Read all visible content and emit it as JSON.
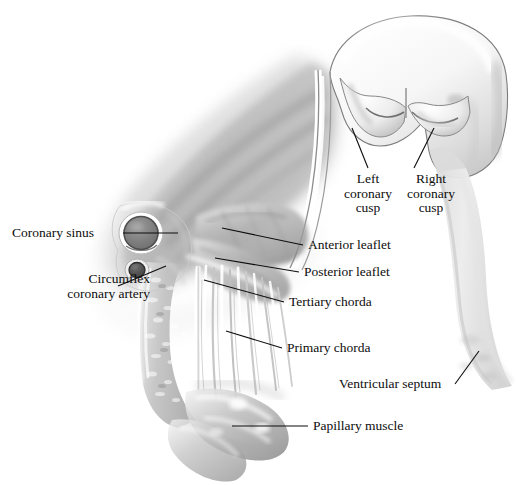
{
  "figure": {
    "kind": "anatomical-illustration",
    "style": "grayscale pencil / airbrush medical rendering",
    "background_color": "#ffffff",
    "ink_color": "#0d0d0d",
    "width": 516,
    "height": 485
  },
  "labels": [
    {
      "id": "coronary-sinus",
      "text": "Coronary sinus",
      "lines": [
        "Coronary sinus"
      ],
      "x": 12,
      "y": 226,
      "align": "left",
      "leader": {
        "from": [
          123,
          233
        ],
        "to": [
          178,
          233
        ]
      }
    },
    {
      "id": "circumflex-artery",
      "text": "Circumflex coronary artery",
      "lines": [
        "Circumflex",
        "coronary artery"
      ],
      "x": 24,
      "y": 272,
      "align": "right",
      "leader": {
        "from": [
          118,
          286
        ],
        "to": [
          166,
          266
        ]
      }
    },
    {
      "id": "left-coronary-cusp",
      "text": "Left coronary cusp",
      "lines": [
        "Left",
        "coronary",
        "cusp"
      ],
      "x": 334,
      "y": 172,
      "align": "center",
      "leader": {
        "from": [
          368,
          168
        ],
        "to": [
          352,
          128
        ]
      }
    },
    {
      "id": "right-coronary-cusp",
      "text": "Right coronary cusp",
      "lines": [
        "Right",
        "coronary",
        "cusp"
      ],
      "x": 397,
      "y": 172,
      "align": "center",
      "leader": {
        "from": [
          414,
          168
        ],
        "to": [
          434,
          128
        ]
      }
    },
    {
      "id": "anterior-leaflet",
      "text": "Anterior leaflet",
      "lines": [
        "Anterior leaflet"
      ],
      "x": 308,
      "y": 238,
      "align": "left",
      "leader": {
        "from": [
          303,
          245
        ],
        "to": [
          222,
          228
        ]
      }
    },
    {
      "id": "posterior-leaflet",
      "text": "Posterior leaflet",
      "lines": [
        "Posterior leaflet"
      ],
      "x": 304,
      "y": 265,
      "align": "left",
      "leader": {
        "from": [
          299,
          272
        ],
        "to": [
          215,
          258
        ]
      }
    },
    {
      "id": "tertiary-chorda",
      "text": "Tertiary chorda",
      "lines": [
        "Tertiary chorda"
      ],
      "x": 289,
      "y": 295,
      "align": "left",
      "leader": {
        "from": [
          284,
          302
        ],
        "to": [
          204,
          280
        ]
      }
    },
    {
      "id": "primary-chorda",
      "text": "Primary chorda",
      "lines": [
        "Primary chorda"
      ],
      "x": 287,
      "y": 341,
      "align": "left",
      "leader": {
        "from": [
          282,
          348
        ],
        "to": [
          226,
          331
        ]
      }
    },
    {
      "id": "ventricular-septum",
      "text": "Ventricular septum",
      "lines": [
        "Ventricular septum"
      ],
      "x": 339,
      "y": 377,
      "align": "left",
      "leader": {
        "from": [
          455,
          384
        ],
        "to": [
          479,
          351
        ]
      }
    },
    {
      "id": "papillary-muscle",
      "text": "Papillary muscle",
      "lines": [
        "Papillary muscle"
      ],
      "x": 313,
      "y": 419,
      "align": "left",
      "leader": {
        "from": [
          308,
          426
        ],
        "to": [
          232,
          426
        ]
      }
    }
  ],
  "structures": [
    {
      "id": "aortic-root",
      "name": "Aortic root / outflow bulb"
    },
    {
      "id": "left-cusp-lobe",
      "name": "Left coronary cusp lobe"
    },
    {
      "id": "right-cusp-lobe",
      "name": "Right coronary cusp lobe"
    },
    {
      "id": "atrial-wall",
      "name": "Left atrial wall, shaded sweep"
    },
    {
      "id": "anterior-leaflet-body",
      "name": "Anterior mitral leaflet"
    },
    {
      "id": "posterior-leaflet-body",
      "name": "Posterior mitral leaflet"
    },
    {
      "id": "chordae",
      "name": "Chordae tendineae strands"
    },
    {
      "id": "papillary-body",
      "name": "Papillary muscle group"
    },
    {
      "id": "trabeculated-wall",
      "name": "Trabeculated ventricular myocardium"
    },
    {
      "id": "septum-band",
      "name": "Ventricular septum band"
    },
    {
      "id": "coronary-sinus-ostium",
      "name": "Coronary sinus ostium, large ring"
    },
    {
      "id": "circumflex-ostium",
      "name": "Circumflex coronary artery, small ring"
    }
  ]
}
